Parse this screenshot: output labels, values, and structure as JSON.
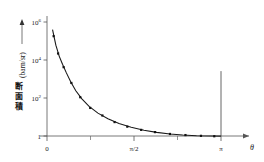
{
  "chart_data": {
    "type": "line",
    "title": "",
    "xlabel": "θ",
    "ylabel": "断面積 (barn/sr)",
    "ylabel_cjk": "断面積",
    "ylabel_unit": "(barn/sr)",
    "yscale": "log",
    "ylim": [
      1,
      1000000
    ],
    "xlim": [
      0,
      3.14159
    ],
    "grid": false,
    "legend": null,
    "xtick_labels": [
      "0",
      "π/2",
      "π"
    ],
    "xtick_values": [
      0,
      1.5708,
      3.14159
    ],
    "xtick_minor_values": [
      0.7854,
      2.3562
    ],
    "ytick_labels": [
      "10",
      "10",
      "10",
      "1"
    ],
    "ytick_exponents": [
      "6",
      "4",
      "2",
      ""
    ],
    "ytick_values": [
      1000000,
      10000,
      100,
      1
    ],
    "series": [
      {
        "name": "differential cross section",
        "x": [
          0.1,
          0.16,
          0.22,
          0.28,
          0.35,
          0.43,
          0.52,
          0.63,
          0.76,
          0.92,
          1.1,
          1.3,
          1.52,
          1.75,
          1.98,
          2.22,
          2.45,
          2.7,
          2.95,
          3.14
        ],
        "y": [
          400000.0,
          60000.0,
          16000.0,
          6000.0,
          2100.0,
          700.0,
          240.0,
          90.0,
          36.0,
          16.0,
          8.2,
          4.6,
          2.9,
          2.0,
          1.55,
          1.28,
          1.13,
          1.04,
          1.0,
          0.98
        ]
      }
    ],
    "markers": {
      "x": [
        0.12,
        0.2,
        0.3,
        0.44,
        0.6,
        0.78,
        1.0,
        1.22,
        1.45,
        1.7,
        1.95,
        2.22,
        2.5,
        2.78,
        3.02
      ],
      "y": [
        180000.0,
        22000.0,
        4200.0,
        620.0,
        110.0,
        30.0,
        12.0,
        5.4,
        3.1,
        2.1,
        1.6,
        1.28,
        1.12,
        1.02,
        0.97
      ]
    },
    "annotations": [
      {
        "name": "vertical-line-at-pi",
        "x": 3.14159,
        "y0": 1.0,
        "y1": 2600.0
      }
    ],
    "axis_arrows": {
      "x": true,
      "y": true
    },
    "colors": {
      "curve": "#1a1a1a",
      "axis": "#555555",
      "marker": "#111111",
      "background": "#ffffff"
    }
  }
}
